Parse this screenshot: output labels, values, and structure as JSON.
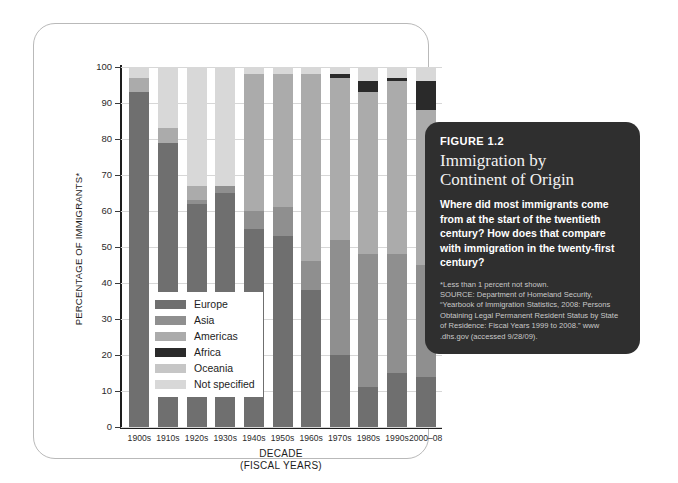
{
  "figure": {
    "number_label": "FIGURE 1.2",
    "title_line1": "Immigration by",
    "title_line2": "Continent of Origin",
    "question": "Where did most immigrants come from at the start of the twentieth century? How does that compare with immigration in the twenty-first century?",
    "footnote": "*Less than 1 percent not shown.",
    "source": "SOURCE: Department of Homeland Security, “Yearbook of Immigration Statistics, 2008: Persons Obtaining Legal Permanent Resident Status by State of Residence: Fiscal Years 1999 to 2008.” www .dhs.gov (accessed 9/28/09)."
  },
  "chart_data": {
    "type": "bar",
    "stacked": true,
    "title": "Immigration by Continent of Origin",
    "xlabel": "DECADE",
    "xlabel_sub": "(FISCAL YEARS)",
    "ylabel": "PERCENTAGE OF IMMIGRANTS*",
    "ylim": [
      0,
      100
    ],
    "yticks": [
      0,
      10,
      20,
      30,
      40,
      50,
      60,
      70,
      80,
      90,
      100
    ],
    "grid": true,
    "legend_position": "inside-left",
    "categories": [
      "1900s",
      "1910s",
      "1920s",
      "1930s",
      "1940s",
      "1950s",
      "1960s",
      "1970s",
      "1980s",
      "1990s",
      "2000–08"
    ],
    "series": [
      {
        "name": "Europe",
        "color": "#6f6f6f",
        "values": [
          93,
          79,
          62,
          65,
          55,
          53,
          38,
          20,
          11,
          15,
          14
        ]
      },
      {
        "name": "Asia",
        "color": "#8f8f8f",
        "values": [
          0,
          0,
          1,
          2,
          5,
          8,
          8,
          32,
          37,
          33,
          31
        ]
      },
      {
        "name": "Americas",
        "color": "#ababab",
        "values": [
          4,
          4,
          4,
          0,
          38,
          37,
          52,
          45,
          45,
          48,
          43
        ]
      },
      {
        "name": "Africa",
        "color": "#2a2a2a",
        "values": [
          0,
          0,
          0,
          0,
          0,
          0,
          0,
          1,
          3,
          1,
          8
        ]
      },
      {
        "name": "Oceania",
        "color": "#c6c6c6",
        "values": [
          0,
          0,
          0,
          0,
          0,
          0,
          0,
          0,
          0,
          0,
          0
        ]
      },
      {
        "name": "Not specified",
        "color": "#d8d8d8",
        "values": [
          3,
          17,
          33,
          33,
          2,
          2,
          2,
          2,
          4,
          3,
          4
        ]
      }
    ]
  }
}
